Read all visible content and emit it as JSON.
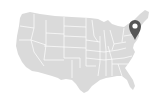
{
  "map": {
    "title": "United States",
    "land_color": "#dadada",
    "border_color": "#ffffff",
    "background_color": "#ffffff",
    "pin": {
      "icon": "map-pin-icon",
      "color": "#555555",
      "inner_color": "#ffffff",
      "location": "Northeast (New York / New England)"
    }
  }
}
